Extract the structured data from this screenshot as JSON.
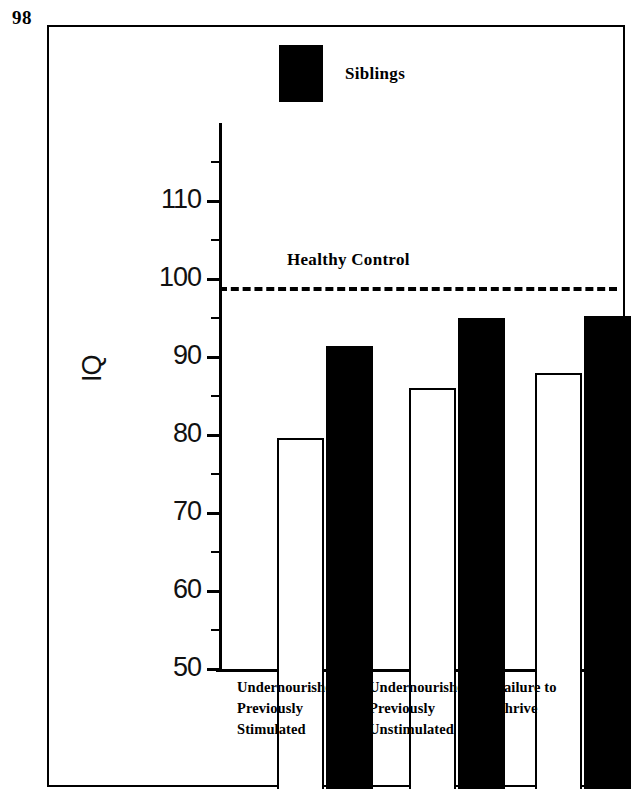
{
  "page_number": "98",
  "legend": {
    "swatch_color": "#000000",
    "label": "Siblings"
  },
  "reference_line": {
    "label": "Healthy Control",
    "value": 99,
    "style": "dashed"
  },
  "axis": {
    "y_title": "IQ",
    "major_ticks": [
      110,
      100,
      90,
      80,
      70,
      60,
      50
    ],
    "minor_ticks": [
      115,
      105,
      95,
      85,
      75,
      65,
      55
    ],
    "y_min": 44,
    "y_max": 116
  },
  "chart_data": {
    "type": "bar",
    "title": "",
    "xlabel": "",
    "ylabel": "IQ",
    "ylim": [
      44,
      116
    ],
    "grid": false,
    "legend_position": "top-center",
    "categories": [
      "Undernourished\nPreviously\nStimulated",
      "Undernourished\nPreviously\nUnstimulated",
      "Failure to\nThrive"
    ],
    "series": [
      {
        "name": "Index cases",
        "fill": "white",
        "values": [
          79.6,
          86.0,
          88.0
        ]
      },
      {
        "name": "Siblings",
        "fill": "black",
        "values": [
          91.4,
          95.0,
          95.3
        ]
      }
    ],
    "reference_lines": [
      {
        "label": "Healthy Control",
        "value": 99
      }
    ],
    "annotations": [
      "Healthy Control"
    ]
  },
  "bars": {
    "g0w": 79.6,
    "g0b": 91.4,
    "g1w": 86.0,
    "g1b": 95.0,
    "g2w": 88.0,
    "g2b": 95.3
  },
  "tick_text": {
    "t110": "110",
    "t100": "100",
    "t90": "90",
    "t80": "80",
    "t70": "70",
    "t60": "60",
    "t50": "50"
  }
}
